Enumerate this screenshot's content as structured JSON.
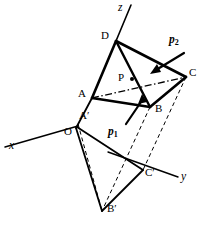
{
  "figure": {
    "stroke_color": "#000000",
    "background_color": "#ffffff",
    "axes": [
      {
        "name": "x-axis",
        "label": "x",
        "label_x": 9,
        "label_y": 141,
        "x1": 5,
        "y1": 147,
        "x2": 78,
        "y2": 126
      },
      {
        "name": "y-axis",
        "label": "y",
        "label_x": 181,
        "label_y": 172,
        "x1": 108,
        "y1": 152,
        "x2": 178,
        "y2": 177
      },
      {
        "name": "z-axis",
        "label": "z",
        "label_x": 118,
        "label_y": 2,
        "x1": 131,
        "y1": 5,
        "x2": 116,
        "y2": 41
      }
    ],
    "points": [
      {
        "name": "D",
        "label": "D",
        "x": 116,
        "y": 41,
        "label_x": 101,
        "label_y": 30
      },
      {
        "name": "C",
        "label": "C",
        "x": 186,
        "y": 77,
        "label_x": 189,
        "label_y": 68
      },
      {
        "name": "A",
        "label": "A",
        "x": 92,
        "y": 98,
        "label_x": 79,
        "label_y": 88
      },
      {
        "name": "B",
        "label": "B",
        "x": 150,
        "y": 107,
        "label_x": 155,
        "label_y": 104
      },
      {
        "name": "P",
        "label": "P",
        "x": 132,
        "y": 79,
        "label_x": 119,
        "label_y": 72
      },
      {
        "name": "A-prime",
        "label": "A′",
        "x": 78,
        "y": 123,
        "label_x": 80,
        "label_y": 111
      },
      {
        "name": "O",
        "label": "O",
        "x": 76,
        "y": 128,
        "label_x": 65,
        "label_y": 127
      },
      {
        "name": "C-prime",
        "label": "C′",
        "x": 143,
        "y": 170,
        "label_x": 146,
        "label_y": 168
      },
      {
        "name": "B-prime",
        "label": "B′",
        "x": 102,
        "y": 211,
        "label_x": 108,
        "label_y": 204
      }
    ],
    "vectors": [
      {
        "name": "p1",
        "label": "p",
        "subscript": "1",
        "label_x": 108,
        "label_y": 127,
        "tail_x": 126,
        "tail_y": 124,
        "tip_x": 142,
        "tip_y": 96
      },
      {
        "name": "p2",
        "label": "p",
        "subscript": "2",
        "label_x": 169,
        "label_y": 35,
        "tail_x": 184,
        "tail_y": 53,
        "tip_x": 151,
        "tip_y": 72
      }
    ],
    "edges_solid": [
      {
        "name": "edge-D-A",
        "x1": 116,
        "y1": 41,
        "x2": 92,
        "y2": 98
      },
      {
        "name": "edge-D-B",
        "x1": 116,
        "y1": 41,
        "x2": 150,
        "y2": 107
      },
      {
        "name": "edge-D-C",
        "x1": 116,
        "y1": 41,
        "x2": 186,
        "y2": 77
      },
      {
        "name": "edge-A-B",
        "x1": 92,
        "y1": 98,
        "x2": 150,
        "y2": 107
      },
      {
        "name": "edge-B-C",
        "x1": 150,
        "y1": 107,
        "x2": 186,
        "y2": 77
      },
      {
        "name": "edge-A-O",
        "x1": 92,
        "y1": 98,
        "x2": 76,
        "y2": 128
      },
      {
        "name": "edge-O-Bprime",
        "x1": 76,
        "y1": 128,
        "x2": 102,
        "y2": 211
      },
      {
        "name": "edge-O-Cprime",
        "x1": 76,
        "y1": 128,
        "x2": 143,
        "y2": 170
      },
      {
        "name": "edge-Bprime-Cprime",
        "x1": 102,
        "y1": 211,
        "x2": 143,
        "y2": 170
      }
    ],
    "edges_dashdot": [
      {
        "name": "edge-A-C-hidden",
        "x1": 92,
        "y1": 98,
        "x2": 186,
        "y2": 77
      }
    ],
    "edges_dashed": [
      {
        "name": "projector-B-Bprime",
        "x1": 150,
        "y1": 107,
        "x2": 102,
        "y2": 211
      },
      {
        "name": "projector-C-Cprime",
        "x1": 186,
        "y1": 77,
        "x2": 143,
        "y2": 170
      },
      {
        "name": "edge-O-Bprime-aux",
        "x1": 78,
        "y1": 124,
        "x2": 102,
        "y2": 211
      }
    ]
  }
}
